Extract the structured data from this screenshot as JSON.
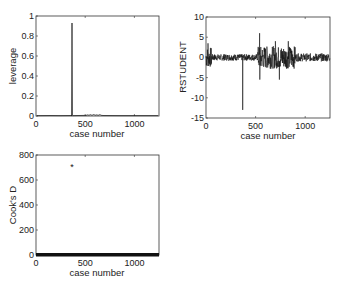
{
  "chart_data": [
    {
      "type": "line",
      "title": "",
      "xlabel": "case number",
      "ylabel": "leverage",
      "xlim": [
        0,
        1250
      ],
      "ylim": [
        0,
        1
      ],
      "xticks": [
        "0",
        "500",
        "1000"
      ],
      "yticks": [
        "0",
        "0.2",
        "0.4",
        "0.6",
        "0.8",
        "1"
      ],
      "grid": false,
      "series": [
        {
          "name": "leverage",
          "points": [
            [
              0,
              0.005
            ],
            [
              360,
              0.005
            ],
            [
              365,
              0.93
            ],
            [
              370,
              0.005
            ],
            [
              520,
              0.01
            ],
            [
              560,
              0.015
            ],
            [
              600,
              0.02
            ],
            [
              640,
              0.015
            ],
            [
              680,
              0.01
            ],
            [
              1250,
              0.005
            ]
          ]
        }
      ]
    },
    {
      "type": "line",
      "title": "",
      "xlabel": "case number",
      "ylabel": "RSTUDENT",
      "xlim": [
        0,
        1250
      ],
      "ylim": [
        -15,
        10
      ],
      "xticks": [
        "0",
        "500",
        "1000"
      ],
      "yticks": [
        "-15",
        "-10",
        "-5",
        "0",
        "5",
        "10"
      ],
      "grid": false,
      "series": [
        {
          "name": "RSTUDENT",
          "annotations": {
            "min": {
              "x": 370,
              "y": -13
            },
            "max": {
              "x": 540,
              "y": 6
            },
            "other_dips": [
              {
                "x": 540,
                "y": -5.5
              },
              {
                "x": 740,
                "y": -5.5
              }
            ]
          }
        }
      ]
    },
    {
      "type": "scatter",
      "title": "",
      "xlabel": "case number",
      "ylabel": "Cook's D",
      "xlim": [
        0,
        1250
      ],
      "ylim": [
        0,
        800
      ],
      "xticks": [
        "0",
        "500",
        "1000"
      ],
      "yticks": [
        "0",
        "200",
        "400",
        "600",
        "800"
      ],
      "grid": false,
      "series": [
        {
          "name": "Cook's D",
          "outlier": {
            "x": 370,
            "y": 690
          },
          "baseline": "all other cases ≈ 0"
        }
      ]
    }
  ],
  "labels": {
    "p1": {
      "xlabel": "case number",
      "ylabel": "leverage",
      "yticks": [
        "0",
        "0.2",
        "0.4",
        "0.6",
        "0.8",
        "1"
      ],
      "xticks": [
        "0",
        "500",
        "1000"
      ]
    },
    "p2": {
      "xlabel": "case number",
      "ylabel": "RSTUDENT",
      "yticks": [
        "-15",
        "-10",
        "-5",
        "0",
        "5",
        "10"
      ],
      "xticks": [
        "0",
        "500",
        "1000"
      ]
    },
    "p3": {
      "xlabel": "case number",
      "ylabel": "Cook's D",
      "yticks": [
        "0",
        "200",
        "400",
        "600",
        "800"
      ],
      "xticks": [
        "0",
        "500",
        "1000"
      ]
    }
  }
}
